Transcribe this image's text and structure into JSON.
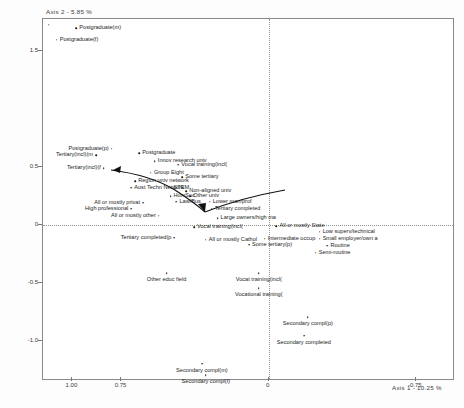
{
  "chart_data": {
    "type": "scatter",
    "title": "",
    "xlabel": "Axis 1 - 10.25 %",
    "ylabel": "Axis 2 - 5.85 %",
    "xlim": [
      1.15,
      -0.95
    ],
    "ylim": [
      -1.35,
      1.78
    ],
    "grid": false,
    "legend": "none",
    "axis_direction_note": "x axis increases to the left",
    "xticks": [
      {
        "value": 1.0,
        "label": "1.00"
      },
      {
        "value": 0.75,
        "label": "0.75"
      },
      {
        "value": 0.0,
        "label": "0"
      },
      {
        "value": -0.75,
        "label": "-0.75"
      }
    ],
    "yticks": [
      {
        "value": 1.5,
        "label": "1.5"
      },
      {
        "value": 0.5,
        "label": "0.5"
      },
      {
        "value": 0.0,
        "label": "0"
      },
      {
        "value": -0.5,
        "label": "-0.5"
      },
      {
        "value": -1.0,
        "label": "-1.0"
      }
    ],
    "reference_lines": [
      {
        "orientation": "horizontal",
        "value": 0.0,
        "style": "dotted"
      },
      {
        "orientation": "vertical",
        "value": 0.0,
        "style": "dotted"
      }
    ],
    "points": [
      {
        "label": "",
        "x": 1.12,
        "y": 1.73,
        "label_pos": "none"
      },
      {
        "label": "Postgraduate(m)",
        "x": 0.98,
        "y": 1.7,
        "label_pos": "right"
      },
      {
        "label": "Postgraduate(f)",
        "x": 1.08,
        "y": 1.6,
        "label_pos": "right"
      },
      {
        "label": "Postgraduate(p)",
        "x": 0.8,
        "y": 0.66,
        "label_pos": "left"
      },
      {
        "label": "Tertiary(incl)(m",
        "x": 0.88,
        "y": 0.6,
        "label_pos": "left"
      },
      {
        "label": "Postgraduate",
        "x": 0.66,
        "y": 0.62,
        "label_pos": "right"
      },
      {
        "label": "Innov research univ",
        "x": 0.58,
        "y": 0.55,
        "label_pos": "right"
      },
      {
        "label": "Tertiary(incl)(f",
        "x": 0.84,
        "y": 0.49,
        "label_pos": "left"
      },
      {
        "label": "Group Eight",
        "x": 0.6,
        "y": 0.45,
        "label_pos": "right"
      },
      {
        "label": "Vocal training(incl(",
        "x": 0.46,
        "y": 0.52,
        "label_pos": "right"
      },
      {
        "label": "Some tertiary",
        "x": 0.44,
        "y": 0.41,
        "label_pos": "right"
      },
      {
        "label": "Region univ network",
        "x": 0.68,
        "y": 0.38,
        "label_pos": "right"
      },
      {
        "label": "Aust Techn Network",
        "x": 0.7,
        "y": 0.32,
        "label_pos": "right"
      },
      {
        "label": "STEM",
        "x": 0.5,
        "y": 0.32,
        "label_pos": "right"
      },
      {
        "label": "Non-aligned univ",
        "x": 0.42,
        "y": 0.29,
        "label_pos": "right"
      },
      {
        "label": "HumSoc",
        "x": 0.5,
        "y": 0.25,
        "label_pos": "right"
      },
      {
        "label": "Other univ",
        "x": 0.4,
        "y": 0.25,
        "label_pos": "right"
      },
      {
        "label": "Law/Bus",
        "x": 0.47,
        "y": 0.2,
        "label_pos": "right"
      },
      {
        "label": "All or mostly privat",
        "x": 0.64,
        "y": 0.19,
        "label_pos": "left"
      },
      {
        "label": "Lower man/prof",
        "x": 0.3,
        "y": 0.2,
        "label_pos": "right"
      },
      {
        "label": "High professional",
        "x": 0.7,
        "y": 0.14,
        "label_pos": "left"
      },
      {
        "label": "Tertiary completed",
        "x": 0.29,
        "y": 0.14,
        "label_pos": "right"
      },
      {
        "label": "All or mostly other",
        "x": 0.56,
        "y": 0.08,
        "label_pos": "left"
      },
      {
        "label": "Large owners/high ma",
        "x": 0.26,
        "y": 0.06,
        "label_pos": "right"
      },
      {
        "label": "Vocal training(incl(",
        "x": 0.38,
        "y": -0.02,
        "label_pos": "right"
      },
      {
        "label": "All or mostly State",
        "x": -0.04,
        "y": -0.01,
        "label_pos": "right"
      },
      {
        "label": "Low superv/technical",
        "x": -0.26,
        "y": -0.06,
        "label_pos": "right"
      },
      {
        "label": "Tertiary completed(p",
        "x": 0.48,
        "y": -0.11,
        "label_pos": "left"
      },
      {
        "label": "All or mostly Cathol",
        "x": 0.32,
        "y": -0.13,
        "label_pos": "right"
      },
      {
        "label": "Intermediate occup",
        "x": 0.02,
        "y": -0.12,
        "label_pos": "right"
      },
      {
        "label": "Small employer/own a",
        "x": -0.26,
        "y": -0.12,
        "label_pos": "right"
      },
      {
        "label": "Some tertiary(p)",
        "x": 0.1,
        "y": -0.17,
        "label_pos": "right"
      },
      {
        "label": "Routine",
        "x": -0.3,
        "y": -0.18,
        "label_pos": "right"
      },
      {
        "label": "Semi-routine",
        "x": -0.24,
        "y": -0.24,
        "label_pos": "right"
      },
      {
        "label": "Other educ field",
        "x": 0.52,
        "y": -0.42,
        "label_pos": "center"
      },
      {
        "label": "Vocat training(incl(",
        "x": 0.05,
        "y": -0.42,
        "label_pos": "center"
      },
      {
        "label": "Vocational training(",
        "x": 0.05,
        "y": -0.55,
        "label_pos": "center"
      },
      {
        "label": "Secondary compl(p)",
        "x": -0.2,
        "y": -0.8,
        "label_pos": "center"
      },
      {
        "label": "Secondary completed",
        "x": -0.18,
        "y": -0.96,
        "label_pos": "center"
      },
      {
        "label": "Secondary compl(m)",
        "x": 0.34,
        "y": -1.2,
        "label_pos": "center"
      },
      {
        "label": "Secondary compl(f)",
        "x": 0.32,
        "y": -1.3,
        "label_pos": "center"
      }
    ],
    "annotations": [
      {
        "name": "trajectory-arrow",
        "description": "curved arrow descending from upper-left cluster toward lower-centre then rising to the right"
      }
    ]
  }
}
